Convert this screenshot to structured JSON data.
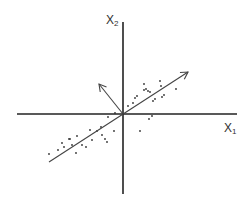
{
  "diagram": {
    "title": "",
    "axes": {
      "x_label": "X",
      "x_sub": "1",
      "y_label": "X",
      "y_sub": "2",
      "origin": [
        123,
        114
      ],
      "x_range_px": [
        17,
        237
      ],
      "y_range_px": [
        22,
        194
      ],
      "color": "#222222"
    },
    "vectors": [
      {
        "name": "principal-component-1",
        "from": [
          49,
          162
        ],
        "to": [
          188,
          72
        ],
        "arrow_at": "to"
      },
      {
        "name": "principal-component-2",
        "from": [
          123,
          114
        ],
        "to": [
          99,
          84
        ],
        "arrow_at": "to"
      }
    ],
    "points": [
      [
        49,
        154
      ],
      [
        58,
        150
      ],
      [
        62,
        143
      ],
      [
        64,
        147
      ],
      [
        69,
        139
      ],
      [
        72,
        145
      ],
      [
        77,
        136
      ],
      [
        70,
        139
      ],
      [
        76,
        153
      ],
      [
        82,
        145
      ],
      [
        86,
        147
      ],
      [
        90,
        130
      ],
      [
        92,
        140
      ],
      [
        97,
        131
      ],
      [
        101,
        127
      ],
      [
        102,
        135
      ],
      [
        105,
        139
      ],
      [
        107,
        142
      ],
      [
        108,
        117
      ],
      [
        114,
        131
      ],
      [
        115,
        113
      ],
      [
        133,
        103
      ],
      [
        135,
        98
      ],
      [
        137,
        96
      ],
      [
        144,
        90
      ],
      [
        144,
        84
      ],
      [
        146,
        89
      ],
      [
        148,
        91
      ],
      [
        150,
        92
      ],
      [
        153,
        101
      ],
      [
        155,
        99
      ],
      [
        160,
        81
      ],
      [
        161,
        86
      ],
      [
        162,
        97
      ],
      [
        164,
        95
      ],
      [
        176,
        89
      ],
      [
        149,
        119
      ],
      [
        140,
        131
      ],
      [
        152,
        116
      ],
      [
        128,
        106
      ]
    ],
    "point_color": "#333333",
    "line_color": "#444444"
  }
}
